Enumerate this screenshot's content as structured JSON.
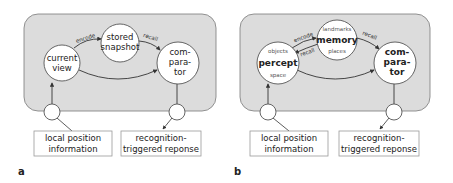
{
  "colors": {
    "panel_fill": "#dcdcdc",
    "panel_stroke": "#7a7a7a",
    "node_fill": "#ffffff",
    "node_stroke": "#555555",
    "arrow": "#333333"
  },
  "panel_a": {
    "label": "a",
    "nodes": {
      "current_view": [
        "current",
        "view"
      ],
      "stored_snapshot": [
        "stored",
        "snapshot"
      ],
      "comparator": [
        "com-",
        "para-",
        "tor"
      ]
    },
    "edges": {
      "encode": "encode",
      "recall": "recall"
    },
    "input_box": [
      "local position",
      "information"
    ],
    "output_box": [
      "recognition-",
      "triggered reponse"
    ]
  },
  "panel_b": {
    "label": "b",
    "nodes": {
      "percept": {
        "top": "objects",
        "main": "percept",
        "bottom": "space"
      },
      "memory": {
        "top": "landmarks",
        "main": "memory",
        "bottom": "places"
      },
      "comparator": [
        "com-",
        "para-",
        "tor"
      ]
    },
    "edges": {
      "encode": "encode",
      "recall_back": "recall",
      "recall": "recall"
    },
    "input_box": [
      "local position",
      "information"
    ],
    "output_box": [
      "recognition-",
      "triggered reponse"
    ]
  }
}
